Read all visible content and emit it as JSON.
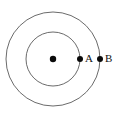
{
  "diagram": {
    "background_color": "#ffffff",
    "ring_color": "#6b6b6b",
    "dot_color": "#0a0a0a",
    "label_color": "#111111",
    "center": {
      "x": 53,
      "y": 59
    },
    "rings": [
      {
        "name": "inner-orbit",
        "radius": 27
      },
      {
        "name": "outer-orbit",
        "radius": 47
      }
    ],
    "points": [
      {
        "name": "center-body",
        "label": "",
        "x": 53,
        "y": 59,
        "radius": 3.2
      },
      {
        "name": "point-a",
        "label": "A",
        "x": 80,
        "y": 59,
        "radius": 3.0,
        "label_x": 85,
        "label_y": 59
      },
      {
        "name": "point-b",
        "label": "B",
        "x": 100,
        "y": 59,
        "radius": 3.0,
        "label_x": 105,
        "label_y": 59
      }
    ]
  }
}
